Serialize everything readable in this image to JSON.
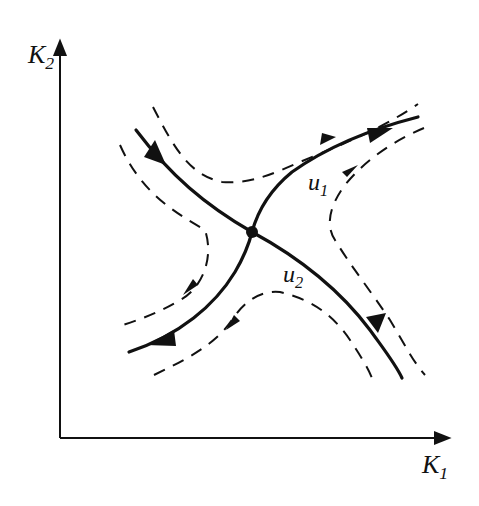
{
  "diagram": {
    "type": "phase-portrait-saddle",
    "axes": {
      "x": {
        "label": "K",
        "subscript": "1"
      },
      "y": {
        "label": "K",
        "subscript": "2"
      }
    },
    "curves": [
      {
        "id": "u1",
        "label": "u",
        "subscript": "1",
        "style": "solid",
        "description": "unstable manifold through saddle, arrows pointing away (toward upper-right and lower-left)"
      },
      {
        "id": "u2",
        "label": "u",
        "subscript": "2",
        "style": "solid",
        "description": "stable manifold through saddle, arrows pointing toward saddle (from upper-left and lower-right)"
      }
    ],
    "neighbor_trajectories": {
      "style": "dashed",
      "count": 4,
      "description": "hyperbolic trajectories in each quadrant around the saddle point"
    },
    "fixed_point": {
      "kind": "saddle"
    },
    "colors": {
      "ink": "#111111",
      "background": "#ffffff"
    }
  }
}
